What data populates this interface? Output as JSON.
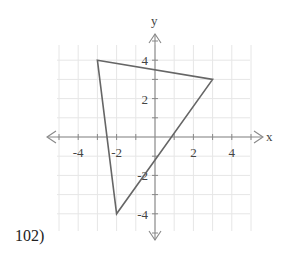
{
  "problem": {
    "label": "102)"
  },
  "chart_data": {
    "type": "polygon-on-coordinate-plane",
    "title": "",
    "xlabel": "x",
    "ylabel": "y",
    "xlim": [
      -5,
      5
    ],
    "ylim": [
      -5,
      5
    ],
    "grid": true,
    "grid_step": 1,
    "x_tick_labels": [
      "-4",
      "-2",
      "2",
      "4"
    ],
    "y_tick_labels": [
      "4",
      "2",
      "-2",
      "-4"
    ],
    "x_tick_values": [
      -4,
      -2,
      2,
      4
    ],
    "y_tick_values": [
      4,
      2,
      -2,
      -4
    ],
    "polygon": {
      "shape": "triangle",
      "vertices": [
        [
          -3,
          4
        ],
        [
          3,
          3
        ],
        [
          -2,
          -4
        ]
      ]
    }
  },
  "colors": {
    "grid": "#e6e6e6",
    "axis": "#888888",
    "shape": "#666666",
    "text": "#444444"
  }
}
